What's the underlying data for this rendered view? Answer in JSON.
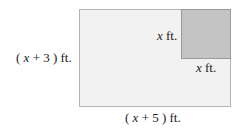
{
  "diagram": {
    "outer_rect": {
      "height_label": {
        "open": "( ",
        "var": "x",
        "rest": " + 3 ) ft."
      },
      "width_label": {
        "open": "( ",
        "var": "x",
        "rest": " + 5 ) ft."
      },
      "fill": "#f2f2f2",
      "stroke": "#b4b4b4"
    },
    "inner_square": {
      "side_label_left": {
        "var": "x",
        "rest": " ft."
      },
      "side_label_bottom": {
        "var": "x",
        "rest": " ft."
      },
      "fill": "#c4c4c4",
      "stroke": "#9a9a9a"
    }
  }
}
